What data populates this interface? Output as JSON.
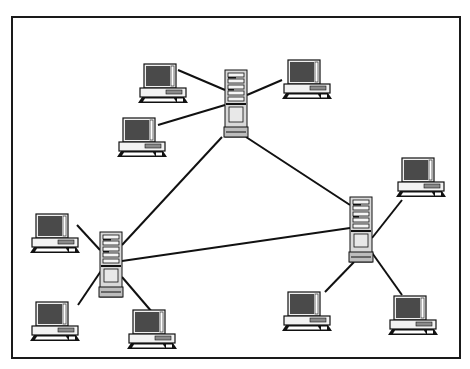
{
  "diagram": {
    "frame": {
      "x": 12,
      "y": 17,
      "width": 448,
      "height": 341,
      "stroke": "#1a1a1a",
      "stroke_width": 2
    },
    "colors": {
      "line": "#111111",
      "screen": "#4a4a4a",
      "body": "#f2f2f2",
      "outline": "#111111",
      "tower": "#d9d9d9",
      "tower_panel": "#bdbdbd"
    },
    "servers": [
      {
        "id": "server-top",
        "x": 225,
        "y": 70,
        "w": 22,
        "h": 67
      },
      {
        "id": "server-left",
        "x": 100,
        "y": 232,
        "w": 22,
        "h": 65
      },
      {
        "id": "server-right",
        "x": 350,
        "y": 197,
        "w": 22,
        "h": 65
      }
    ],
    "computers": [
      {
        "id": "pc-top-1",
        "x": 138,
        "y": 64,
        "server": "server-top"
      },
      {
        "id": "pc-top-2",
        "x": 282,
        "y": 60,
        "server": "server-top"
      },
      {
        "id": "pc-top-3",
        "x": 117,
        "y": 118,
        "server": "server-top"
      },
      {
        "id": "pc-left-1",
        "x": 30,
        "y": 214,
        "server": "server-left"
      },
      {
        "id": "pc-left-2",
        "x": 30,
        "y": 302,
        "server": "server-left"
      },
      {
        "id": "pc-left-3",
        "x": 127,
        "y": 310,
        "server": "server-left"
      },
      {
        "id": "pc-right-1",
        "x": 396,
        "y": 158,
        "server": "server-right"
      },
      {
        "id": "pc-right-2",
        "x": 282,
        "y": 292,
        "server": "server-right"
      },
      {
        "id": "pc-right-3",
        "x": 388,
        "y": 296,
        "server": "server-right"
      }
    ],
    "links": [
      {
        "from": [
          222,
          137
        ],
        "to": [
          122,
          245
        ]
      },
      {
        "from": [
          246,
          137
        ],
        "to": [
          350,
          205
        ]
      },
      {
        "from": [
          122,
          261
        ],
        "to": [
          350,
          228
        ]
      },
      {
        "from": [
          178,
          70
        ],
        "to": [
          225,
          90
        ]
      },
      {
        "from": [
          282,
          80
        ],
        "to": [
          247,
          95
        ]
      },
      {
        "from": [
          158,
          125
        ],
        "to": [
          225,
          105
        ]
      },
      {
        "from": [
          77,
          225
        ],
        "to": [
          100,
          250
        ]
      },
      {
        "from": [
          78,
          305
        ],
        "to": [
          103,
          268
        ]
      },
      {
        "from": [
          152,
          312
        ],
        "to": [
          122,
          277
        ]
      },
      {
        "from": [
          402,
          200
        ],
        "to": [
          372,
          238
        ]
      },
      {
        "from": [
          325,
          292
        ],
        "to": [
          354,
          262
        ]
      },
      {
        "from": [
          402,
          295
        ],
        "to": [
          370,
          250
        ]
      }
    ]
  }
}
